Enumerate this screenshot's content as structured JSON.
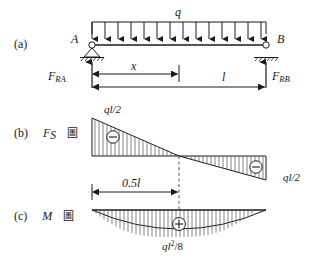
{
  "figure": {
    "title_implicit": "Simply supported beam under uniformly distributed load with shear and moment diagrams",
    "panels": [
      {
        "tag": "(a)",
        "caption": ""
      },
      {
        "tag": "(b)",
        "caption_symbol": "F",
        "caption_sub": "S",
        "caption_cjk": "圖"
      },
      {
        "tag": "(c)",
        "caption_symbol": "M",
        "caption_cjk": "圖"
      }
    ],
    "beam": {
      "left_node_label": "A",
      "right_node_label": "B",
      "distributed_load_label": "q",
      "left_support_type": "pin-support",
      "right_support_type": "roller-support",
      "arrow_count": 14
    },
    "reactions": {
      "left": {
        "symbol": "F",
        "sub": "RA"
      },
      "right": {
        "symbol": "F",
        "sub": "RB"
      }
    },
    "dimensions": {
      "x_label": "x",
      "length_label": "l",
      "half_length_label": "0.5l",
      "half_length_value": "0.5",
      "half_length_unit": "l"
    },
    "shear_diagram": {
      "left_peak_label": "ql/2",
      "right_peak_label": "ql/2",
      "left_sign": "−",
      "right_sign": "−",
      "left_sign_name": "minus-sign-marker",
      "right_sign_name": "minus-sign-marker"
    },
    "moment_diagram": {
      "peak_label_main": "ql",
      "peak_label_exponent": "2",
      "peak_label_divisor": "/8",
      "peak_label_full": "ql²/8",
      "sign": "+",
      "sign_name": "plus-sign-marker"
    },
    "colors": {
      "line": "#1a1a1a",
      "hatch": "#4d4d4d",
      "background": "#ffffff",
      "dashed": "#555555"
    }
  }
}
